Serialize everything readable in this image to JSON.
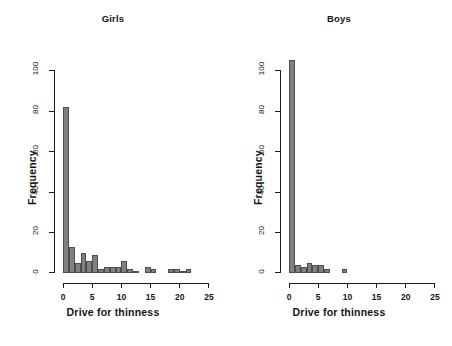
{
  "figure": {
    "background": "#ffffff",
    "bar_fill": "#808080",
    "bar_border": "#4d4d4d",
    "axis_color": "#1a1a1a"
  },
  "chart_data": [
    {
      "type": "bar",
      "title": "Girls",
      "xlabel": "Drive for thinness",
      "ylabel": "Frequency",
      "grid": false,
      "legend": "none",
      "xlim": [
        0,
        25
      ],
      "ylim": [
        0,
        105
      ],
      "xticks": [
        "0",
        "5",
        "10",
        "15",
        "20",
        "25"
      ],
      "xtick_values": [
        0,
        5,
        10,
        15,
        20,
        25
      ],
      "yticks": [
        "0",
        "20",
        "40",
        "60",
        "80",
        "100"
      ],
      "ytick_values": [
        0,
        20,
        40,
        60,
        80,
        100
      ],
      "bin_width": 1,
      "categories": [
        "0-1",
        "1-2",
        "2-3",
        "3-4",
        "4-5",
        "5-6",
        "6-7",
        "7-8",
        "8-9",
        "9-10",
        "10-11",
        "11-12",
        "12-13",
        "13-14",
        "14-15",
        "15-16",
        "16-17",
        "17-18",
        "18-19",
        "19-20",
        "20-21",
        "21-22",
        "22-23",
        "23-24",
        "24-25"
      ],
      "bin_starts": [
        0,
        1,
        2,
        3,
        4,
        5,
        6,
        7,
        8,
        9,
        10,
        11,
        12,
        13,
        14,
        15,
        16,
        17,
        18,
        19,
        20,
        21,
        22,
        23,
        24
      ],
      "values": [
        82,
        13,
        5,
        10,
        6,
        9,
        2,
        3,
        3,
        3,
        6,
        2,
        1,
        0,
        3,
        2,
        0,
        0,
        2,
        2,
        1,
        2,
        0,
        0,
        0
      ]
    },
    {
      "type": "bar",
      "title": "Boys",
      "xlabel": "Drive for thinness",
      "ylabel": "Frequency",
      "grid": false,
      "legend": "none",
      "xlim": [
        0,
        25
      ],
      "ylim": [
        0,
        105
      ],
      "xticks": [
        "0",
        "5",
        "10",
        "15",
        "20",
        "25"
      ],
      "xtick_values": [
        0,
        5,
        10,
        15,
        20,
        25
      ],
      "yticks": [
        "0",
        "20",
        "40",
        "60",
        "80",
        "100"
      ],
      "ytick_values": [
        0,
        20,
        40,
        60,
        80,
        100
      ],
      "bin_width": 1,
      "categories": [
        "0-1",
        "1-2",
        "2-3",
        "3-4",
        "4-5",
        "5-6",
        "6-7",
        "7-8",
        "8-9",
        "9-10",
        "10-11",
        "11-12",
        "12-13",
        "13-14",
        "14-15",
        "15-16",
        "16-17",
        "17-18",
        "18-19",
        "19-20",
        "20-21",
        "21-22",
        "22-23",
        "23-24",
        "24-25"
      ],
      "bin_starts": [
        0,
        1,
        2,
        3,
        4,
        5,
        6,
        7,
        8,
        9,
        10,
        11,
        12,
        13,
        14,
        15,
        16,
        17,
        18,
        19,
        20,
        21,
        22,
        23,
        24
      ],
      "values": [
        105,
        4,
        3,
        5,
        4,
        4,
        2,
        0,
        0,
        2,
        0,
        0,
        0,
        0,
        0,
        0,
        0,
        0,
        0,
        0,
        0,
        0,
        0,
        0,
        0
      ]
    }
  ]
}
